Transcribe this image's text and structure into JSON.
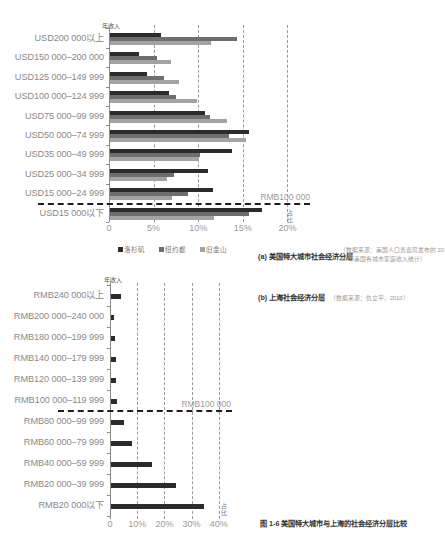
{
  "chart_data": [
    {
      "id": "a",
      "type": "bar",
      "orientation": "horizontal",
      "title": "(a) 美国特大城市社会经济分层",
      "subtitle": "（数据来源：美国人口普查局发布的 2010 年美国各城市家庭收入统计）",
      "ylabel": "年收入",
      "xlabel": "占比",
      "xlim": [
        0,
        20
      ],
      "xticks": [
        {
          "value": 0,
          "label": "0"
        },
        {
          "value": 5,
          "label": "5%"
        },
        {
          "value": 10,
          "label": "10%"
        },
        {
          "value": 15,
          "label": "15%"
        },
        {
          "value": 20,
          "label": "20%"
        }
      ],
      "grid": "dashed vertical at 5% intervals",
      "legend_position": "bottom",
      "categories": [
        "USD200 000以上",
        "USD150 000–200 000",
        "USD125 000–149 999",
        "USD100 000–124 999",
        "USD75 000–99 999",
        "USD50 000–74 999",
        "USD35 000–49 999",
        "USD25 000–34 999",
        "USD15 000–24 999",
        "USD15 000以下"
      ],
      "series": [
        {
          "name": "洛杉矶",
          "color": "#2b2b2b",
          "values": [
            5.8,
            3.4,
            4.3,
            6.7,
            10.8,
            15.7,
            13.8,
            11.1,
            11.7,
            17.1
          ]
        },
        {
          "name": "纽约都",
          "color": "#6e6e6e",
          "values": [
            14.3,
            5.4,
            6.2,
            7.5,
            11.3,
            13.5,
            10.2,
            7.3,
            8.9,
            15.7
          ]
        },
        {
          "name": "旧金山",
          "color": "#a3a3a3",
          "values": [
            11.4,
            7.0,
            7.9,
            9.9,
            13.2,
            15.4,
            10.1,
            6.5,
            7.1,
            11.8
          ]
        }
      ],
      "annotations": [
        {
          "text": "RMB100 000",
          "type": "dashed threshold line",
          "between": [
            "USD15 000–24 999",
            "USD15 000以下"
          ]
        }
      ]
    },
    {
      "id": "b",
      "type": "bar",
      "orientation": "horizontal",
      "title": "(b) 上海社会经济分层",
      "subtitle": "（数据来源：仇立平，2010）",
      "ylabel": "年收入",
      "xlabel": "占比",
      "xlim": [
        0,
        40
      ],
      "xticks": [
        {
          "value": 0,
          "label": "0"
        },
        {
          "value": 10,
          "label": "10%"
        },
        {
          "value": 20,
          "label": "20%"
        },
        {
          "value": 30,
          "label": "30%"
        },
        {
          "value": 40,
          "label": "40%"
        }
      ],
      "grid": "dashed vertical at 10% intervals",
      "categories": [
        "RMB240 000以上",
        "RMB200 000–240 000",
        "RMB180 000–199 999",
        "RMB140 000–179 999",
        "RMB120 000–139 999",
        "RMB100 000–119 999",
        "RMB80 000–99 999",
        "RMB60 000–79 999",
        "RMB40 000–59 999",
        "RMB20 000–39 999",
        "RMB20 000以下"
      ],
      "series": [
        {
          "name": "上海",
          "color": "#2b2b2b",
          "values": [
            4.0,
            1.3,
            1.7,
            2.3,
            2.2,
            2.4,
            5.1,
            8.1,
            15.4,
            24.3,
            34.4
          ]
        }
      ],
      "annotations": [
        {
          "text": "RMB100 000",
          "type": "dashed threshold line",
          "between": [
            "RMB100 000–119 999",
            "RMB80 000–99 999"
          ]
        }
      ]
    }
  ],
  "figure_caption": "图 1-6 美国特大城市与上海的社会经济分层比较"
}
